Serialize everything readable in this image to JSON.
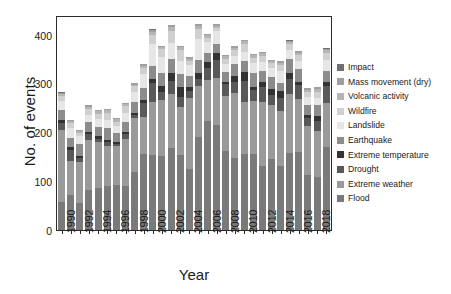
{
  "chart_data": {
    "type": "bar",
    "stacked": true,
    "title": "",
    "xlabel": "Year",
    "ylabel": "No. of events",
    "ylim": [
      0,
      440
    ],
    "yticks": [
      0,
      100,
      200,
      300,
      400
    ],
    "grid": false,
    "legend_position": "right",
    "x_tick_labels": [
      "1990",
      "1992",
      "1994",
      "1996",
      "1998",
      "2000",
      "2002",
      "2004",
      "2006",
      "2008",
      "2010",
      "2012",
      "2014",
      "2016",
      "2018"
    ],
    "categories": [
      "1990",
      "1991",
      "1992",
      "1993",
      "1994",
      "1995",
      "1996",
      "1997",
      "1998",
      "1999",
      "2000",
      "2001",
      "2002",
      "2003",
      "2004",
      "2005",
      "2006",
      "2007",
      "2008",
      "2009",
      "2010",
      "2011",
      "2012",
      "2013",
      "2014",
      "2015",
      "2016",
      "2017",
      "2018",
      "2019"
    ],
    "series": [
      {
        "name": "Flood",
        "color": "#7a7a7a",
        "values": [
          58,
          71,
          56,
          82,
          87,
          91,
          92,
          90,
          118,
          155,
          153,
          152,
          168,
          154,
          124,
          190,
          224,
          215,
          162,
          148,
          155,
          155,
          131,
          146,
          132,
          158,
          159,
          112,
          108,
          169
        ]
      },
      {
        "name": "Extreme weather",
        "color": "#9a9a9a",
        "values": [
          146,
          70,
          84,
          102,
          93,
          80,
          80,
          97,
          111,
          76,
          110,
          114,
          110,
          97,
          146,
          105,
          84,
          96,
          112,
          133,
          106,
          109,
          130,
          109,
          112,
          120,
          110,
          100,
          94,
          91
        ]
      },
      {
        "name": "Drought",
        "color": "#595959",
        "values": [
          15,
          23,
          7,
          12,
          7,
          9,
          5,
          10,
          6,
          28,
          38,
          16,
          26,
          22,
          14,
          15,
          23,
          37,
          24,
          22,
          44,
          22,
          31,
          22,
          27,
          32,
          28,
          17,
          21,
          34
        ]
      },
      {
        "name": "Extreme temperature",
        "color": "#333333",
        "values": [
          7,
          5,
          4,
          4,
          5,
          5,
          3,
          4,
          5,
          8,
          8,
          12,
          17,
          20,
          9,
          12,
          13,
          15,
          5,
          12,
          18,
          7,
          11,
          12,
          13,
          12,
          5,
          6,
          11,
          9
        ]
      },
      {
        "name": "Earthquake",
        "color": "#8c8c8c",
        "values": [
          20,
          20,
          26,
          21,
          19,
          24,
          18,
          21,
          22,
          24,
          27,
          28,
          29,
          27,
          22,
          27,
          18,
          18,
          20,
          25,
          23,
          29,
          22,
          25,
          17,
          28,
          28,
          20,
          22,
          22
        ]
      },
      {
        "name": "Landslide",
        "color": "#e6e6e6",
        "values": [
          18,
          20,
          15,
          15,
          16,
          17,
          15,
          18,
          20,
          28,
          44,
          32,
          33,
          26,
          23,
          42,
          22,
          26,
          16,
          17,
          19,
          19,
          19,
          17,
          25,
          18,
          16,
          17,
          15,
          24
        ]
      },
      {
        "name": "Wildfire",
        "color": "#d0d0d0",
        "values": [
          10,
          10,
          6,
          11,
          10,
          13,
          9,
          13,
          12,
          13,
          20,
          16,
          25,
          22,
          9,
          20,
          10,
          7,
          11,
          12,
          15,
          12,
          12,
          10,
          11,
          12,
          13,
          11,
          12,
          14
        ]
      },
      {
        "name": "Volcanic activity",
        "color": "#b5b5b5",
        "values": [
          4,
          4,
          4,
          5,
          6,
          6,
          5,
          5,
          3,
          4,
          6,
          4,
          7,
          6,
          4,
          6,
          5,
          4,
          6,
          4,
          6,
          5,
          6,
          4,
          5,
          4,
          4,
          4,
          6,
          5
        ]
      },
      {
        "name": "Mass movement (dry)",
        "color": "#9f9f9f",
        "values": [
          3,
          3,
          3,
          3,
          3,
          3,
          3,
          3,
          3,
          3,
          4,
          3,
          4,
          3,
          3,
          4,
          3,
          3,
          3,
          3,
          3,
          3,
          3,
          3,
          3,
          3,
          3,
          3,
          3,
          3
        ]
      },
      {
        "name": "Impact",
        "color": "#6f6f6f",
        "values": [
          1,
          0,
          0,
          0,
          0,
          0,
          0,
          0,
          0,
          0,
          1,
          0,
          1,
          0,
          0,
          1,
          0,
          0,
          0,
          0,
          1,
          0,
          0,
          0,
          0,
          1,
          0,
          0,
          0,
          1
        ]
      }
    ],
    "legend_entries": [
      {
        "label": "Impact",
        "color": "#6f6f6f"
      },
      {
        "label": "Mass movement (dry)",
        "color": "#9f9f9f"
      },
      {
        "label": "Volcanic activity",
        "color": "#b5b5b5"
      },
      {
        "label": "Wildfire",
        "color": "#d0d0d0"
      },
      {
        "label": "Landslide",
        "color": "#e6e6e6"
      },
      {
        "label": "Earthquake",
        "color": "#8c8c8c"
      },
      {
        "label": "Extreme temperature",
        "color": "#333333"
      },
      {
        "label": "Drought",
        "color": "#595959"
      },
      {
        "label": "Extreme weather",
        "color": "#9a9a9a"
      },
      {
        "label": "Flood",
        "color": "#7a7a7a"
      }
    ]
  }
}
